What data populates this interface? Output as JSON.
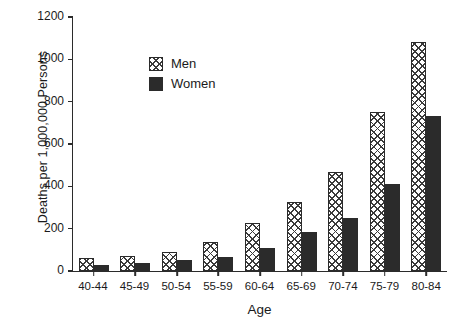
{
  "chart_data": {
    "type": "bar",
    "title": "",
    "xlabel": "Age",
    "ylabel": "Deaths per 1,000,000 Persons",
    "categories": [
      "40-44",
      "45-49",
      "50-54",
      "55-59",
      "60-64",
      "65-69",
      "70-74",
      "75-79",
      "80-84"
    ],
    "series": [
      {
        "name": "Men",
        "values": [
          63,
          70,
          88,
          137,
          225,
          327,
          468,
          752,
          1080
        ]
      },
      {
        "name": "Women",
        "values": [
          28,
          38,
          50,
          68,
          108,
          186,
          249,
          410,
          732
        ]
      }
    ],
    "ylim": [
      0,
      1200
    ],
    "yticks": [
      0,
      200,
      400,
      600,
      800,
      1000,
      1200
    ],
    "ytick_labels": [
      "0",
      "200",
      "400",
      "600",
      "800",
      "1000",
      "1200"
    ],
    "grid": false,
    "legend_position": "top-left",
    "colors": {
      "men_fill": "#ffffff",
      "men_hatch": "#3a3a3a",
      "women_fill": "#2b2b2b",
      "axis": "#2b2b2b",
      "text": "#1a1a1a",
      "background": "#ffffff"
    }
  }
}
